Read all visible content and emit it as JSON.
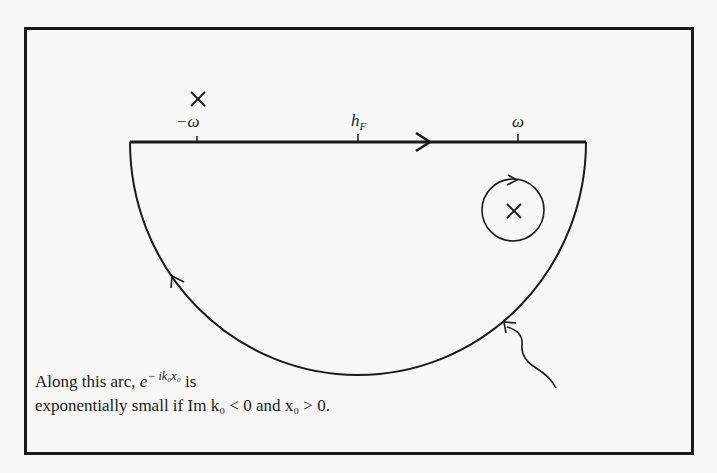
{
  "figure": {
    "labels": {
      "neg_omega": "−ω",
      "h_f": "h",
      "h_f_sub": "F",
      "omega": "ω"
    },
    "caption": {
      "line1_prefix": "Along this arc, ",
      "line1_exp_base": "e",
      "line1_exp_sup": "− ik₀x₀",
      "line1_suffix": " is",
      "line2": "exponentially small if Im k₀ < 0 and x₀ > 0."
    },
    "markers": {
      "pole_top": "×",
      "pole_circle": "×"
    },
    "colors": {
      "ink": "#1a1a1a",
      "background": "#f7f7f5"
    }
  }
}
